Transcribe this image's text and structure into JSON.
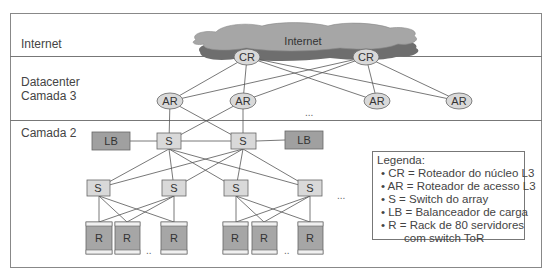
{
  "layers": {
    "internet": "Internet",
    "datacenter_l3_line1": "Datacenter",
    "datacenter_l3_line2": "Camada 3",
    "layer2": "Camada 2"
  },
  "cloud": {
    "label": "Internet",
    "color": "#a6a6a6",
    "shadow": "#6e6e6e"
  },
  "nodes": {
    "core_routers": [
      {
        "label": "CR",
        "cx": 247,
        "cy": 57
      },
      {
        "label": "CR",
        "cx": 366,
        "cy": 57
      }
    ],
    "access_routers": [
      {
        "label": "AR",
        "cx": 170,
        "cy": 101
      },
      {
        "label": "AR",
        "cx": 243,
        "cy": 101
      },
      {
        "label": "AR",
        "cx": 377,
        "cy": 101
      },
      {
        "label": "AR",
        "cx": 459,
        "cy": 101
      }
    ],
    "load_balancers": [
      {
        "label": "LB",
        "x": 92,
        "y": 132
      },
      {
        "label": "LB",
        "x": 285,
        "y": 131
      }
    ],
    "agg_switches": [
      {
        "label": "S",
        "x": 157,
        "y": 133
      },
      {
        "label": "S",
        "x": 231,
        "y": 133
      }
    ],
    "access_switches": [
      {
        "label": "S",
        "x": 87,
        "y": 180
      },
      {
        "label": "S",
        "x": 162,
        "y": 180
      },
      {
        "label": "S",
        "x": 224,
        "y": 180
      },
      {
        "label": "S",
        "x": 298,
        "y": 180
      }
    ],
    "racks": [
      {
        "label": "R",
        "x": 86
      },
      {
        "label": "R",
        "x": 115
      },
      {
        "label": "R",
        "x": 161
      },
      {
        "label": "R",
        "x": 223
      },
      {
        "label": "R",
        "x": 252
      },
      {
        "label": "R",
        "x": 298
      }
    ]
  },
  "ellipses": {
    "ar_row": "...",
    "switch_row": "...",
    "rack_group_1": "..",
    "rack_group_2": ".."
  },
  "legend": {
    "title": "Legenda:",
    "items": [
      "• CR = Roteador do núcleo L3",
      "• AR = Roteador de acesso L3",
      "• S = Switch do array",
      "• LB = Balanceador de carga",
      "• R = Rack de 80 servidores"
    ],
    "continuation": "com switch ToR"
  },
  "colors": {
    "router_fill": "#d9d9d9",
    "switch_fill": "#d9d9d9",
    "lb_fill": "#a0a0a0",
    "rack_fill": "#a6a6a6",
    "line": "#555555"
  }
}
